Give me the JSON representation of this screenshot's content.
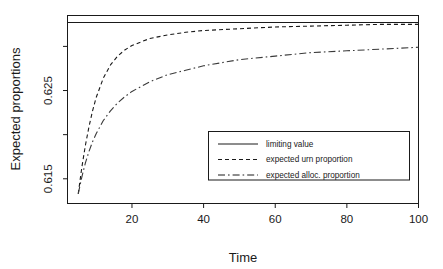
{
  "chart_data": {
    "type": "line",
    "title": "",
    "xlabel": "Time",
    "ylabel": "Expected proportions",
    "xlim": [
      2,
      100
    ],
    "ylim": [
      0.6122,
      0.6335
    ],
    "grid": false,
    "legend_position": "center-right-inside",
    "x_ticks": [
      20,
      40,
      60,
      80,
      100
    ],
    "x_tick_labels": [
      "20",
      "40",
      "60",
      "80",
      "100"
    ],
    "y_ticks": [
      0.615,
      0.62,
      0.625,
      0.63
    ],
    "y_tick_labels": [
      "0.615",
      "",
      "0.625",
      ""
    ],
    "y_labeled_ticks": [
      {
        "value": 0.625,
        "label": "0.625"
      },
      {
        "value": 0.615,
        "label": "0.615"
      }
    ],
    "series": [
      {
        "name": "limiting value",
        "style": "solid",
        "color": "#1a1a1a",
        "x": [
          2,
          100
        ],
        "values": [
          0.6327,
          0.6327
        ]
      },
      {
        "name": "expected urn proportion",
        "style": "dashed",
        "color": "#1a1a1a",
        "x": [
          5,
          6,
          7,
          8,
          9,
          10,
          12,
          14,
          16,
          18,
          20,
          25,
          30,
          35,
          40,
          50,
          60,
          70,
          80,
          90,
          100
        ],
        "values": [
          0.6133,
          0.6163,
          0.6188,
          0.6209,
          0.6227,
          0.6242,
          0.6264,
          0.6279,
          0.6289,
          0.6296,
          0.6301,
          0.6309,
          0.6313,
          0.6316,
          0.6318,
          0.632,
          0.6322,
          0.6323,
          0.6324,
          0.6325,
          0.6325
        ]
      },
      {
        "name": "expected alloc. proportion",
        "style": "dashdot",
        "color": "#3a3a3a",
        "x": [
          5,
          6,
          7,
          8,
          9,
          10,
          12,
          14,
          16,
          18,
          20,
          25,
          30,
          35,
          40,
          50,
          60,
          70,
          80,
          90,
          100
        ],
        "values": [
          0.6133,
          0.6152,
          0.6168,
          0.6181,
          0.6192,
          0.6201,
          0.6216,
          0.6227,
          0.6236,
          0.6243,
          0.6249,
          0.626,
          0.6268,
          0.6273,
          0.6278,
          0.6285,
          0.6289,
          0.6293,
          0.6295,
          0.6297,
          0.6299
        ]
      }
    ],
    "legend": [
      {
        "label": "limiting value",
        "style": "solid"
      },
      {
        "label": "expected urn proportion",
        "style": "dashed"
      },
      {
        "label": "expected alloc. proportion",
        "style": "dashdot"
      }
    ]
  }
}
